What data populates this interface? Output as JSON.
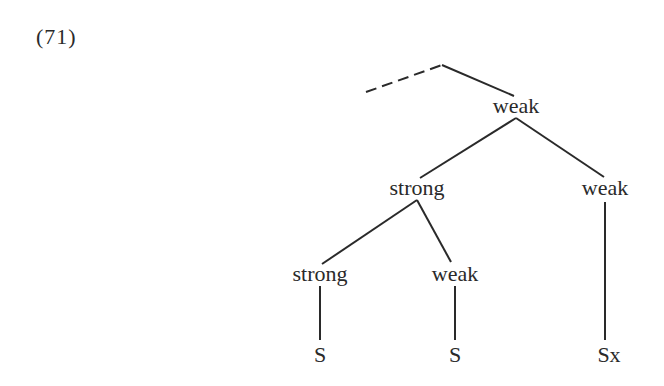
{
  "example_label": "(71)",
  "tree": {
    "root": {
      "label": "weak"
    },
    "level2": [
      {
        "label": "strong"
      },
      {
        "label": "weak"
      }
    ],
    "level3": [
      {
        "label": "strong"
      },
      {
        "label": "weak"
      }
    ],
    "leaves": [
      {
        "label": "S"
      },
      {
        "label": "S"
      },
      {
        "label": "Sx"
      }
    ],
    "upper_edge": {
      "style": "dashed",
      "note": "continues to higher node"
    }
  }
}
